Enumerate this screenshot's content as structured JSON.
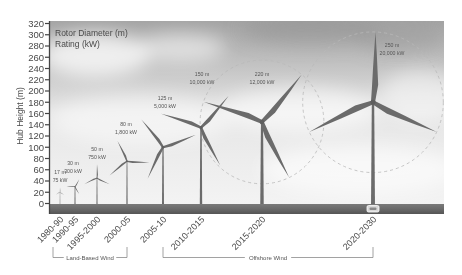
{
  "chart_data": {
    "type": "bar",
    "title": "",
    "xlabel": "",
    "ylabel": "Hub Height (m)",
    "ylim": [
      0,
      320
    ],
    "yticks": [
      0,
      20,
      40,
      60,
      80,
      100,
      120,
      140,
      160,
      180,
      200,
      220,
      240,
      260,
      280,
      300,
      320
    ],
    "grid": false,
    "legend": {
      "position": "top-left",
      "entries": [
        "Rotor Diameter (m)",
        "Rating (kW)"
      ]
    },
    "categories": [
      "1980-90",
      "1990-95",
      "1995-2000",
      "2000-05",
      "2005-10",
      "2010-2015",
      "2015-2020",
      "2020-2030"
    ],
    "series": [
      {
        "name": "Hub Height (m)",
        "values": [
          20,
          30,
          45,
          75,
          100,
          135,
          145,
          180
        ]
      },
      {
        "name": "Rotor Diameter (m)",
        "values": [
          17,
          30,
          50,
          80,
          125,
          150,
          220,
          250
        ]
      },
      {
        "name": "Rating (kW)",
        "values": [
          75,
          300,
          750,
          1800,
          5000,
          10000,
          12000,
          20000
        ]
      }
    ],
    "annotations": [
      {
        "diameter": "17 m",
        "rating": "75 kW"
      },
      {
        "diameter": "30 m",
        "rating": "300 kW"
      },
      {
        "diameter": "50 m",
        "rating": "750 kW"
      },
      {
        "diameter": "80 m",
        "rating": "1,800 kW"
      },
      {
        "diameter": "125 m",
        "rating": "5,000 kW"
      },
      {
        "diameter": "150 m",
        "rating": "10,000 kW"
      },
      {
        "diameter": "220 m",
        "rating": "12,000 kW"
      },
      {
        "diameter": "250 m",
        "rating": "20,000 kW"
      }
    ],
    "groups": [
      {
        "label": "Land-Based Wind",
        "categories": [
          "1980-90",
          "1990-95",
          "1995-2000",
          "2000-05"
        ]
      },
      {
        "label": "Offshore Wind",
        "categories": [
          "2005-10",
          "2010-2015",
          "2015-2020",
          "2020-2030"
        ]
      }
    ]
  },
  "colors": {
    "sky_top": "#a4a4a4",
    "sky_bottom": "#f2f2f2",
    "ground": "#666666",
    "turbine": "#6b6b6b",
    "text": "#4a4a4a"
  }
}
